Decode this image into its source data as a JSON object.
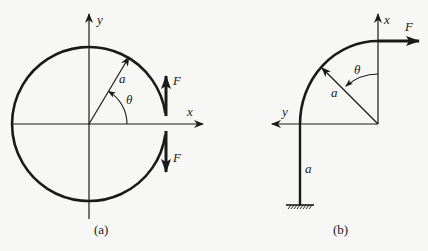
{
  "figure_a": {
    "caption": "(a)",
    "axis_x_label": "x",
    "axis_y_label": "y",
    "radius_label": "a",
    "angle_label": "θ",
    "force_upper_label": "F",
    "force_lower_label": "F",
    "description": "Split circular ring of radius a with opposing forces F applied at the cut on the x-axis"
  },
  "figure_b": {
    "caption": "(b)",
    "axis_x_label": "x",
    "axis_y_label": "y",
    "radius_label": "a",
    "angle_label": "θ",
    "force_label": "F",
    "post_length_label": "a",
    "description": "Quarter-circle bar of radius a on a vertical post of length a fixed to the ground, force F applied horizontally at the free end"
  },
  "colors": {
    "ink": "#1a1a1a",
    "background": "#f7f7f5"
  }
}
